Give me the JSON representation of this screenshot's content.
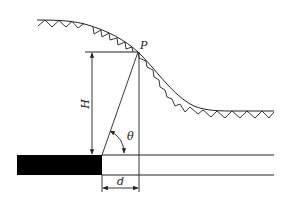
{
  "diagram": {
    "type": "engineering-geometry",
    "labels": {
      "point": "P",
      "height": "H",
      "angle": "θ",
      "offset": "d"
    },
    "colors": {
      "line": "#222222",
      "block": "#000000",
      "background": "#ffffff"
    }
  }
}
